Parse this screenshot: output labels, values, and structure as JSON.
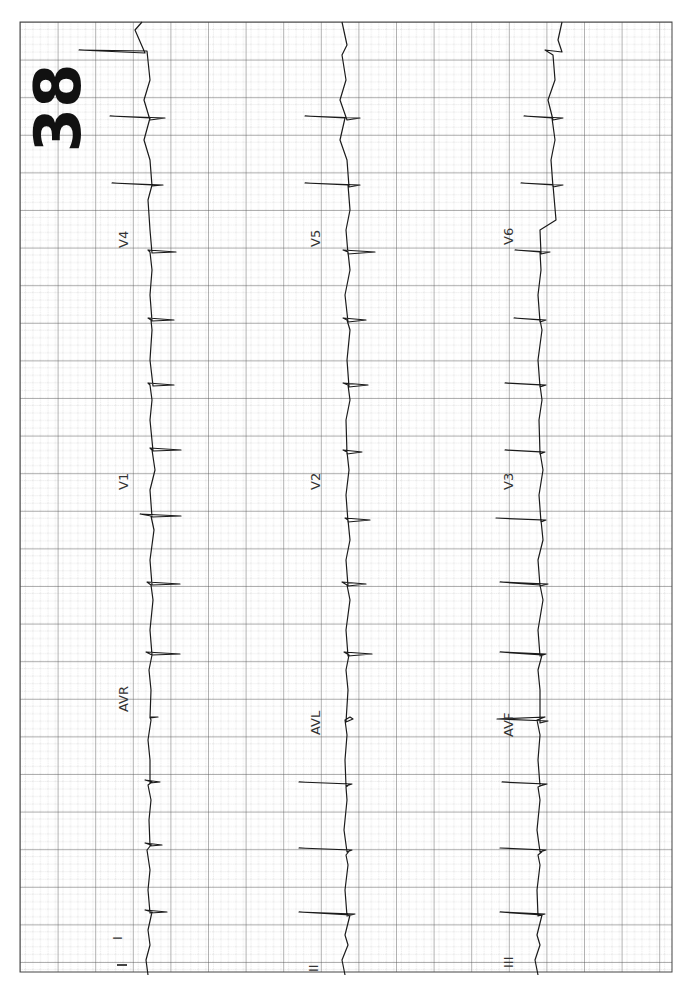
{
  "page": {
    "number": "38",
    "orientation": "rotated-90-clockwise"
  },
  "grid": {
    "left": 20,
    "top": 22,
    "right": 672,
    "bottom": 972,
    "major_spacing_px": 37.6,
    "minor_per_major": 5,
    "major_color": "#4a4a4a",
    "minor_color": "#b8b8b8"
  },
  "strips": [
    {
      "name": "row-1",
      "baseline_x": 148,
      "leads": [
        {
          "label": "I",
          "label_pos": [
            122,
            940
          ]
        },
        {
          "label": "AVR",
          "label_pos": [
            122,
            700
          ]
        },
        {
          "label": "V1",
          "label_pos": [
            122,
            470
          ]
        },
        {
          "label": "V4",
          "label_pos": [
            122,
            240
          ]
        }
      ]
    },
    {
      "name": "row-2",
      "baseline_x": 345,
      "leads": [
        {
          "label": "II",
          "label_pos": [
            316,
            940
          ]
        },
        {
          "label": "AVL",
          "label_pos": [
            316,
            700
          ]
        },
        {
          "label": "V2",
          "label_pos": [
            316,
            470
          ]
        },
        {
          "label": "V5",
          "label_pos": [
            316,
            240
          ]
        }
      ]
    },
    {
      "name": "row-3",
      "baseline_x": 538,
      "leads": [
        {
          "label": "III",
          "label_pos": [
            508,
            940
          ]
        },
        {
          "label": "AVF",
          "label_pos": [
            508,
            700
          ]
        },
        {
          "label": "V3",
          "label_pos": [
            508,
            470
          ]
        },
        {
          "label": "V6",
          "label_pos": [
            508,
            240
          ]
        }
      ]
    }
  ]
}
